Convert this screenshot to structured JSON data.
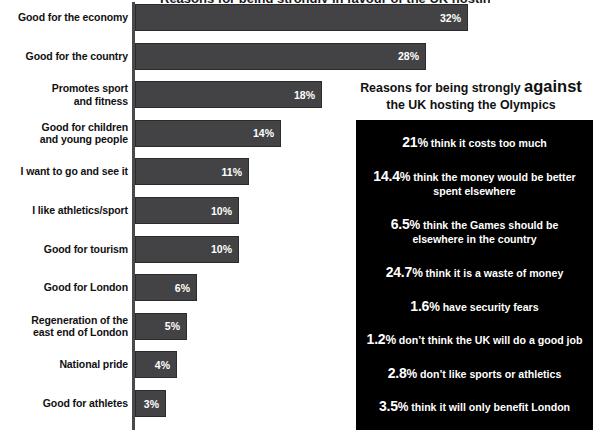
{
  "chart_title_partial": "Reasons for being strongly in favour of the UK hosting the Olympics",
  "chart_data": {
    "type": "bar",
    "orientation": "horizontal",
    "title": "",
    "xlabel": "",
    "ylabel": "",
    "xlim": [
      0,
      32
    ],
    "grid": false,
    "legend": null,
    "categories": [
      "Good for the economy",
      "Good for the country",
      "Promotes sport and fitness",
      "Good for children and young people",
      "I want to go and see it",
      "I like athletics/sport",
      "Good for tourism",
      "Good for London",
      "Regeneration of the east end of London",
      "National pride",
      "Good for athletes"
    ],
    "values": [
      32,
      28,
      18,
      14,
      11,
      10,
      10,
      6,
      5,
      4,
      3
    ],
    "value_labels": [
      "32%",
      "28%",
      "18%",
      "14%",
      "11%",
      "10%",
      "10%",
      "6%",
      "5%",
      "4%",
      "3%"
    ]
  },
  "bars": [
    {
      "label_line1": "Good for the economy",
      "label_line2": "",
      "value": 32,
      "value_label": "32%"
    },
    {
      "label_line1": "Good for the country",
      "label_line2": "",
      "value": 28,
      "value_label": "28%"
    },
    {
      "label_line1": "Promotes sport",
      "label_line2": "and fitness",
      "value": 18,
      "value_label": "18%"
    },
    {
      "label_line1": "Good for children",
      "label_line2": "and young people",
      "value": 14,
      "value_label": "14%"
    },
    {
      "label_line1": "I want to go and see it",
      "label_line2": "",
      "value": 11,
      "value_label": "11%"
    },
    {
      "label_line1": "I like athletics/sport",
      "label_line2": "",
      "value": 10,
      "value_label": "10%"
    },
    {
      "label_line1": "Good for tourism",
      "label_line2": "",
      "value": 10,
      "value_label": "10%"
    },
    {
      "label_line1": "Good for London",
      "label_line2": "",
      "value": 6,
      "value_label": "6%"
    },
    {
      "label_line1": "Regeneration of the",
      "label_line2": "east end of London",
      "value": 5,
      "value_label": "5%"
    },
    {
      "label_line1": "National pride",
      "label_line2": "",
      "value": 4,
      "value_label": "4%"
    },
    {
      "label_line1": "Good for athletes",
      "label_line2": "",
      "value": 3,
      "value_label": "3%"
    }
  ],
  "panel": {
    "heading_part1": "Reasons for being strongly ",
    "heading_emph": "against",
    "heading_part2": "the UK hosting the Olympics",
    "reasons": [
      {
        "pct": "21",
        "sym": "%",
        "text": "think it costs too much"
      },
      {
        "pct": "14.4",
        "sym": "%",
        "text": "think the money would be better spent elsewhere"
      },
      {
        "pct": "6.5",
        "sym": "%",
        "text": "think the Games should be elsewhere in the country"
      },
      {
        "pct": "24.7",
        "sym": "%",
        "text": "think it is a waste of money"
      },
      {
        "pct": "1.6",
        "sym": "%",
        "text": "have security fears"
      },
      {
        "pct": "1.2",
        "sym": "%",
        "text": "don’t think the UK will do a good job"
      },
      {
        "pct": "2.8",
        "sym": "%",
        "text": "don’t like sports or athletics"
      },
      {
        "pct": "3.5",
        "sym": "%",
        "text": "think it will only benefit London"
      }
    ]
  },
  "colors": {
    "bar_fill": "#434346",
    "bar_border": "#2b2b2e",
    "axis": "#4a4a4d",
    "panel_bg": "#000000",
    "panel_text": "#ffffff",
    "page_bg": "#ffffff",
    "label_text": "#111111"
  }
}
